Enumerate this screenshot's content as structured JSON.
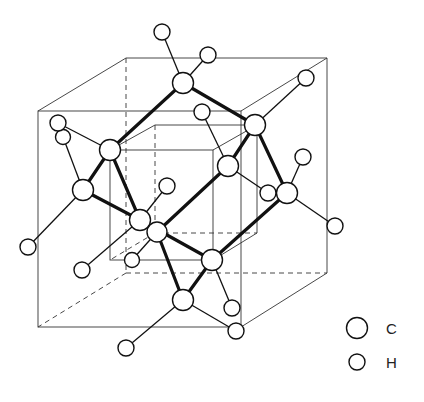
{
  "figure": {
    "title": "",
    "colors": {
      "line": "#111111",
      "atom_fill": "#ffffff",
      "background": "#ffffff"
    }
  },
  "legend": {
    "items": [
      {
        "symbol": "large-circle",
        "label": "C"
      },
      {
        "symbol": "small-circle",
        "label": "H"
      }
    ]
  },
  "structure": {
    "outer_cube": {
      "front": [
        [
          38,
          111
        ],
        [
          241,
          111
        ],
        [
          241,
          327
        ],
        [
          38,
          327
        ]
      ],
      "back": [
        [
          126,
          58
        ],
        [
          327,
          58
        ],
        [
          327,
          273
        ],
        [
          126,
          273
        ]
      ]
    },
    "inner_cube": {
      "front": [
        [
          110,
          150
        ],
        [
          213,
          150
        ],
        [
          213,
          260
        ],
        [
          110,
          260
        ]
      ],
      "back": [
        [
          155,
          125
        ],
        [
          257,
          125
        ],
        [
          257,
          233
        ],
        [
          155,
          233
        ]
      ]
    },
    "carbons": [
      [
        183,
        83
      ],
      [
        110,
        150
      ],
      [
        255,
        125
      ],
      [
        83,
        190
      ],
      [
        140,
        220
      ],
      [
        157,
        232
      ],
      [
        287,
        193
      ],
      [
        228,
        166
      ],
      [
        212,
        260
      ],
      [
        183,
        300
      ]
    ],
    "hydrogens": [
      [
        162,
        32
      ],
      [
        208,
        55
      ],
      [
        306,
        78
      ],
      [
        58,
        123
      ],
      [
        63,
        137
      ],
      [
        202,
        112
      ],
      [
        167,
        186
      ],
      [
        303,
        157
      ],
      [
        268,
        193
      ],
      [
        335,
        226
      ],
      [
        28,
        247
      ],
      [
        82,
        270
      ],
      [
        132,
        260
      ],
      [
        232,
        308
      ],
      [
        236,
        331
      ],
      [
        126,
        348
      ]
    ]
  }
}
